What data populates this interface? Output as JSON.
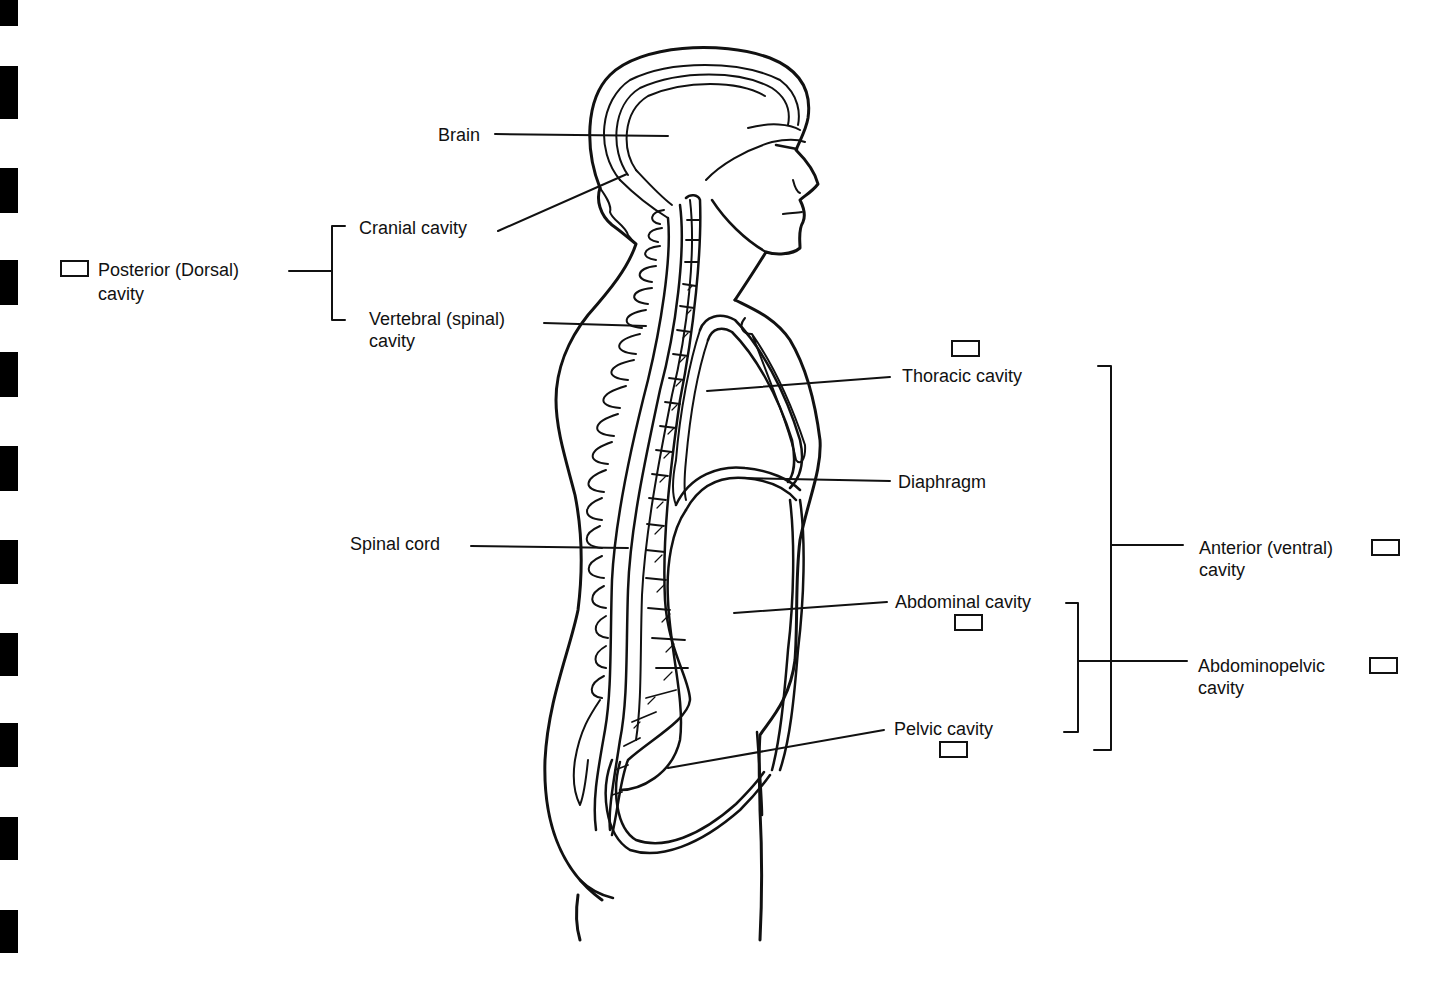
{
  "figure": {
    "labels": {
      "brain": "Brain",
      "cranial_cavity": "Cranial cavity",
      "posterior_line1": "Posterior (Dorsal)",
      "posterior_line2": "cavity",
      "vertebral_line1": "Vertebral (spinal)",
      "vertebral_line2": "cavity",
      "spinal_cord": "Spinal cord",
      "thoracic_cavity": "Thoracic cavity",
      "diaphragm": "Diaphragm",
      "abdominal_cavity": "Abdominal cavity",
      "pelvic_cavity": "Pelvic cavity",
      "anterior_line1": "Anterior (ventral)",
      "anterior_line2": "cavity",
      "abdominopelvic_line1": "Abdominopelvic",
      "abdominopelvic_line2": "cavity"
    },
    "checkboxes": [
      {
        "id": "posterior",
        "checked": false
      },
      {
        "id": "thoracic",
        "checked": false
      },
      {
        "id": "anterior",
        "checked": false
      },
      {
        "id": "abdominal",
        "checked": false
      },
      {
        "id": "abdominopelvic",
        "checked": false
      },
      {
        "id": "pelvic",
        "checked": false
      }
    ],
    "colors": {
      "ink": "#111111",
      "paper": "#ffffff",
      "edge_marks": "#000000"
    }
  }
}
